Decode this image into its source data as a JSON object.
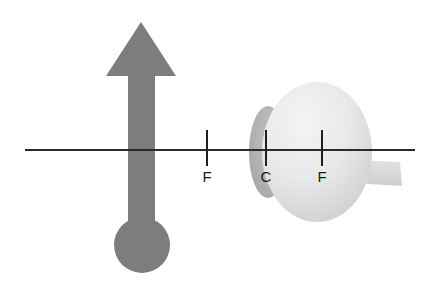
{
  "figure": {
    "background_color": "#ffffff",
    "width": 433,
    "height": 292
  },
  "colors": {
    "background": "#ffffff",
    "axis_line": "#2b2b2b",
    "object_gray": "#7d7d7d",
    "sclera_light": "#ececec",
    "sclera_mid": "#e0e0e0",
    "sclera_shadow": "#d2d2d2",
    "cornea_gray": "#b4b4b4",
    "cornea_edge": "#a8a8a8",
    "optic_nerve": "#d8d8d8",
    "tick_mark": "#1f1f1f",
    "label_text": "#1a1a1a"
  },
  "optical_axis": {
    "name": "optical-axis",
    "y": 150,
    "x_start": 25,
    "x_end": 415,
    "stroke_width": 2
  },
  "object": {
    "name": "object-arrow",
    "description": "upright gray arrow with rounded base representing the object",
    "color": "#7d7d7d",
    "center_x": 142,
    "arrowhead": {
      "apex_x": 141,
      "apex_y": 22,
      "left_x": 106,
      "right_x": 176,
      "base_y": 76
    },
    "shaft": {
      "x": 128,
      "y": 70,
      "width": 27,
      "height": 170
    },
    "base_ellipse": {
      "cx": 142,
      "cy": 245,
      "rx": 28,
      "ry": 28
    }
  },
  "eye": {
    "name": "eyeball",
    "sphere": {
      "cx": 317,
      "cy": 152,
      "rx": 55,
      "ry": 70
    },
    "cornea": {
      "cx": 268,
      "cy": 152,
      "rx": 18,
      "ry": 45
    },
    "optic_nerve": {
      "x": 366,
      "y": 158,
      "width": 36,
      "height": 26
    }
  },
  "markers": [
    {
      "id": "focal-point-left",
      "label": "F",
      "meaning": "focal point",
      "x": 207,
      "tick_top": 130,
      "tick_bottom": 166,
      "label_x": 207,
      "label_y": 182
    },
    {
      "id": "center-of-curvature",
      "label": "C",
      "meaning": "center of curvature at cornea",
      "x": 266,
      "tick_top": 130,
      "tick_bottom": 166,
      "label_x": 266,
      "label_y": 182
    },
    {
      "id": "focal-point-right",
      "label": "F",
      "meaning": "focal point inside eye",
      "x": 322,
      "tick_top": 130,
      "tick_bottom": 166,
      "label_x": 322,
      "label_y": 182
    }
  ]
}
